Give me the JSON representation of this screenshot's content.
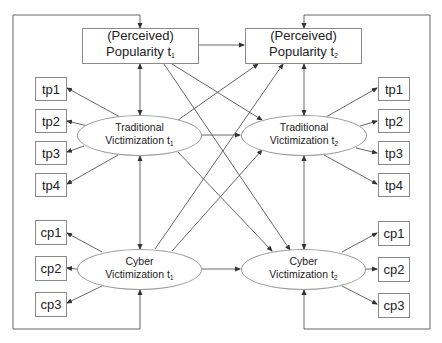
{
  "diagram": {
    "type": "cross-lagged structural equation path model",
    "popularity_t1": {
      "line1": "(Perceived)",
      "line2": "Popularity t",
      "sub": "1"
    },
    "popularity_t2": {
      "line1": "(Perceived)",
      "line2": "Popularity t",
      "sub": "2"
    },
    "traditional_t1": {
      "line1": "Traditional",
      "line2": "Victimization t",
      "sub": "1"
    },
    "traditional_t2": {
      "line1": "Traditional",
      "line2": "Victimization t",
      "sub": "2"
    },
    "cyber_t1": {
      "line1": "Cyber",
      "line2": "Victimization t",
      "sub": "1"
    },
    "cyber_t2": {
      "line1": "Cyber",
      "line2": "Victimization t",
      "sub": "2"
    },
    "left_indicators": [
      "tp1",
      "tp2",
      "tp3",
      "tp4",
      "cp1",
      "cp2",
      "cp3"
    ],
    "right_indicators": [
      "tp1",
      "tp2",
      "tp3",
      "tp4",
      "cp1",
      "cp2",
      "cp3"
    ],
    "paths": [
      "Popularity t1 -> Popularity t2",
      "Traditional Victimization t1 -> Traditional Victimization t2",
      "Cyber Victimization t1 -> Cyber Victimization t2",
      "Popularity t1 -> Traditional Victimization t2",
      "Popularity t1 -> Cyber Victimization t2",
      "Traditional Victimization t1 -> Popularity t2",
      "Traditional Victimization t1 -> Cyber Victimization t2",
      "Cyber Victimization t1 -> Popularity t2",
      "Cyber Victimization t1 -> Traditional Victimization t2",
      "Popularity t1 <-> Traditional Victimization t1",
      "Traditional Victimization t1 <-> Cyber Victimization t1",
      "Popularity t2 <-> Traditional Victimization t2",
      "Traditional Victimization t2 <-> Cyber Victimization t2",
      "Popularity t1 <-> Cyber Victimization t1 (outer loop)",
      "Popularity t2 <-> Cyber Victimization t2 (outer loop)"
    ]
  }
}
